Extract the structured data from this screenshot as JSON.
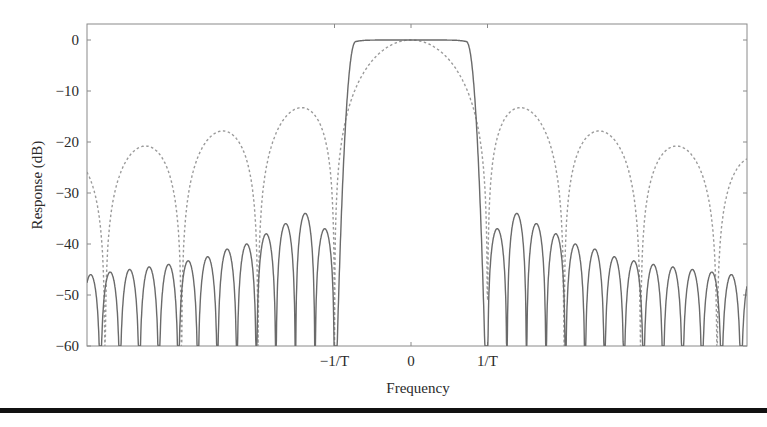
{
  "chart_data": {
    "type": "line",
    "title": "",
    "xlabel": "Frequency",
    "ylabel": "Response (dB)",
    "ylim": [
      -60,
      0
    ],
    "xlim_in_units_of_1_over_T": [
      -4.24,
      4.4
    ],
    "yticks": [
      0,
      -10,
      -20,
      -30,
      -40,
      -50,
      -60
    ],
    "ytick_labels": [
      "0",
      "−10",
      "−20",
      "−30",
      "−40",
      "−50",
      "−60"
    ],
    "xticks": [
      -1,
      0,
      1
    ],
    "xtick_labels": [
      "−1/T",
      "0",
      "1/T"
    ],
    "grid": false,
    "legend": null,
    "series": [
      {
        "name": "solid (shaped pulse response)",
        "style": "solid",
        "passband_edge_1_over_T": 0.72,
        "stopband_edge_1_over_T": 1.0,
        "passband_level_db": 0,
        "sidelobe_period_1_over_T": 0.255,
        "sidelobe_peaks_right_db": [
          -37,
          -34,
          -36,
          -38,
          -40,
          -41,
          -42.5,
          -43.3,
          -44,
          -44.5,
          -45,
          -45.5,
          -46,
          -46.5,
          -47
        ],
        "sidelobe_peaks_left_db": [
          -37,
          -34,
          -36,
          -38,
          -40,
          -41,
          -42.5,
          -43.3,
          -44,
          -44.5,
          -45,
          -45.5,
          -46,
          -46.5,
          -46.5
        ]
      },
      {
        "name": "dashed (sinc / rectangular pulse response)",
        "style": "dashed",
        "null_spacing_1_over_T": 1.0,
        "mainlobe_peak_db": 0,
        "sidelobe_peaks_db": [
          -13.3,
          -17.8,
          -20.8,
          -22.9
        ]
      }
    ]
  },
  "axes": {
    "xlabel": "Frequency",
    "ylabel": "Response (dB)"
  }
}
